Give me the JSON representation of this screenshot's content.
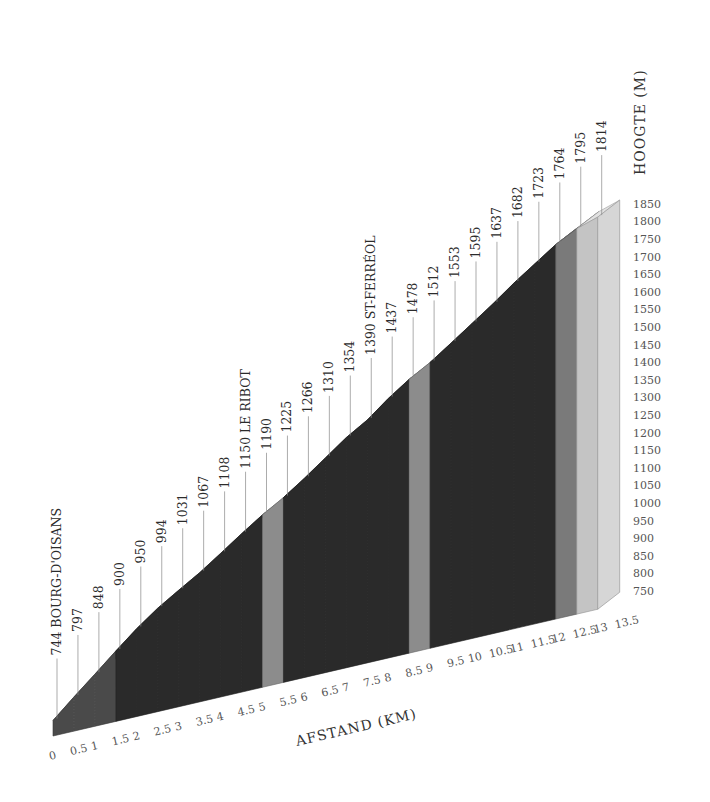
{
  "chart_data": {
    "type": "area",
    "style": "3d-climb-profile",
    "title": "",
    "xlabel": "AFSTAND (KM)",
    "ylabel": "HOOGTE (M)",
    "x_ticks": [
      "0",
      "0.5",
      "1",
      "1.5",
      "2",
      "2.5",
      "3",
      "3.5",
      "4",
      "4.5",
      "5",
      "5.5",
      "6",
      "6.5",
      "7",
      "7.5",
      "8",
      "8.5",
      "9",
      "9.5",
      "10",
      "10.5",
      "11",
      "11.5",
      "12",
      "12.5",
      "13",
      "13.5"
    ],
    "y_ticks": [
      "750",
      "800",
      "850",
      "900",
      "950",
      "1000",
      "1050",
      "1100",
      "1150",
      "1200",
      "1250",
      "1300",
      "1350",
      "1400",
      "1450",
      "1500",
      "1550",
      "1600",
      "1650",
      "1700",
      "1750",
      "1800",
      "1850"
    ],
    "xlim": [
      0,
      13.5
    ],
    "ylim": [
      750,
      1850
    ],
    "grid": false,
    "series": [
      {
        "name": "elevation",
        "x": [
          0,
          0.5,
          1,
          1.5,
          2,
          2.5,
          3,
          3.5,
          4,
          4.5,
          5,
          5.5,
          6,
          6.5,
          7,
          7.5,
          8,
          8.5,
          9,
          9.5,
          10,
          10.5,
          11,
          11.5,
          12,
          12.5
        ],
        "values": [
          744,
          797,
          848,
          900,
          950,
          994,
          1031,
          1067,
          1108,
          1150,
          1190,
          1225,
          1266,
          1310,
          1354,
          1390,
          1437,
          1478,
          1512,
          1553,
          1595,
          1637,
          1682,
          1723,
          1764,
          1795
        ]
      }
    ],
    "summit": {
      "x": 13,
      "value": 1814
    },
    "point_labels": [
      "744",
      "797",
      "848",
      "900",
      "950",
      "994",
      "1031",
      "1067",
      "1108",
      "1150",
      "1190",
      "1225",
      "1266",
      "1310",
      "1354",
      "1390",
      "1437",
      "1478",
      "1512",
      "1553",
      "1595",
      "1637",
      "1682",
      "1723",
      "1764",
      "1795",
      "1814"
    ],
    "annotations": [
      {
        "x": 0,
        "text": "BOURG-D'OISANS"
      },
      {
        "x": 4.5,
        "text": "LE RIBOT"
      },
      {
        "x": 7.5,
        "text": "ST-FERRÉOL"
      }
    ],
    "segments": [
      {
        "from": 0,
        "to": 1.5,
        "color": "#4a4a4a",
        "gradient_class": "medium"
      },
      {
        "from": 1.5,
        "to": 5,
        "color": "#2a2a2a",
        "gradient_class": "steep"
      },
      {
        "from": 5,
        "to": 5.5,
        "color": "#8c8c8c",
        "gradient_class": "easier"
      },
      {
        "from": 5.5,
        "to": 8.5,
        "color": "#2a2a2a",
        "gradient_class": "steep"
      },
      {
        "from": 8.5,
        "to": 9,
        "color": "#8c8c8c",
        "gradient_class": "easier"
      },
      {
        "from": 9,
        "to": 12,
        "color": "#2a2a2a",
        "gradient_class": "steep"
      },
      {
        "from": 12,
        "to": 12.5,
        "color": "#7a7a7a",
        "gradient_class": "moderate"
      },
      {
        "from": 12.5,
        "to": 13,
        "color": "#c4c4c4",
        "gradient_class": "flat"
      }
    ]
  }
}
